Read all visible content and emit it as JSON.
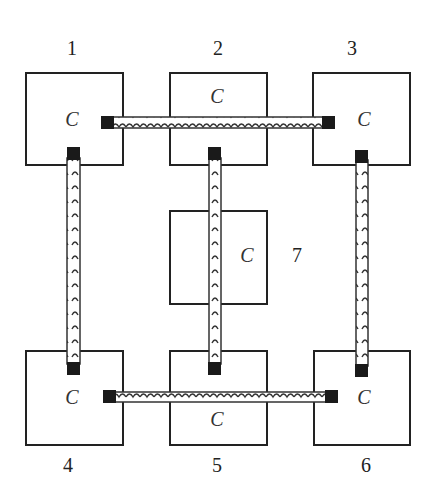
{
  "diagram": {
    "type": "cell-routing",
    "cells": [
      {
        "id": "1",
        "label": "C",
        "number": "1",
        "x": 26,
        "y": 73,
        "w": 97,
        "h": 92,
        "cx": 72,
        "cy": 126
      },
      {
        "id": "2",
        "label": "C",
        "number": "2",
        "x": 170,
        "y": 73,
        "w": 97,
        "h": 92,
        "cx": 217,
        "cy": 103
      },
      {
        "id": "3",
        "label": "C",
        "number": "3",
        "x": 313,
        "y": 73,
        "w": 97,
        "h": 92,
        "cx": 364,
        "cy": 126
      },
      {
        "id": "7",
        "label": "C",
        "number": "7",
        "x": 170,
        "y": 211,
        "w": 97,
        "h": 93,
        "cx": 247,
        "cy": 262
      },
      {
        "id": "4",
        "label": "C",
        "number": "4",
        "x": 26,
        "y": 351,
        "w": 97,
        "h": 94,
        "cx": 72,
        "cy": 404
      },
      {
        "id": "5",
        "label": "C",
        "number": "5",
        "x": 170,
        "y": 351,
        "w": 97,
        "h": 94,
        "cx": 217,
        "cy": 426
      },
      {
        "id": "6",
        "label": "C",
        "number": "6",
        "x": 314,
        "y": 351,
        "w": 96,
        "h": 94,
        "cx": 364,
        "cy": 404
      }
    ],
    "numbers": [
      {
        "text": "1",
        "x": 72,
        "y": 55
      },
      {
        "text": "2",
        "x": 218,
        "y": 55
      },
      {
        "text": "3",
        "x": 352,
        "y": 55
      },
      {
        "text": "7",
        "x": 297,
        "y": 262
      },
      {
        "text": "4",
        "x": 68,
        "y": 472
      },
      {
        "text": "5",
        "x": 217,
        "y": 472
      },
      {
        "text": "6",
        "x": 366,
        "y": 472
      }
    ],
    "wires": [
      {
        "id": "w1-3",
        "from": "1",
        "to": "3",
        "orientation": "horizontal"
      },
      {
        "id": "w1-4",
        "from": "1",
        "to": "4",
        "orientation": "vertical"
      },
      {
        "id": "w2-5",
        "from": "2",
        "to": "5",
        "orientation": "vertical"
      },
      {
        "id": "w3-6",
        "from": "3",
        "to": "6",
        "orientation": "vertical"
      },
      {
        "id": "w4-6",
        "from": "4",
        "to": "6",
        "orientation": "horizontal"
      }
    ]
  }
}
